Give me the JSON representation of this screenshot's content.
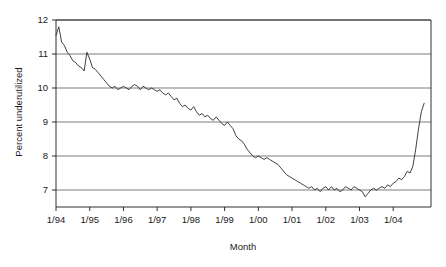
{
  "chart_data": {
    "type": "line",
    "title": "",
    "xlabel": "Month",
    "ylabel": "Percent underutilized",
    "ylim": [
      6.5,
      12
    ],
    "yticks": [
      7,
      8,
      9,
      10,
      11,
      12
    ],
    "ytick_labels": [
      "7",
      "8",
      "9",
      "10",
      "11",
      "12"
    ],
    "xtick_labels": [
      "1/94",
      "1/95",
      "1/96",
      "1/97",
      "1/98",
      "1/99",
      "1/00",
      "1/01",
      "1/02",
      "1/03",
      "1/04"
    ],
    "grid": "horizontal",
    "legend": "none",
    "line_color": "#2b2b2b",
    "grid_color": "#6e6e6e",
    "axis_color": "#1a1a1a",
    "x_start_label": "1/94",
    "x_end_label": "12/04",
    "x": [
      "1/94",
      "2/94",
      "3/94",
      "4/94",
      "5/94",
      "6/94",
      "7/94",
      "8/94",
      "9/94",
      "10/94",
      "11/94",
      "12/94",
      "1/95",
      "2/95",
      "3/95",
      "4/95",
      "5/95",
      "6/95",
      "7/95",
      "8/95",
      "9/95",
      "10/95",
      "11/95",
      "12/95",
      "1/96",
      "2/96",
      "3/96",
      "4/96",
      "5/96",
      "6/96",
      "7/96",
      "8/96",
      "9/96",
      "10/96",
      "11/96",
      "12/96",
      "1/97",
      "2/97",
      "3/97",
      "4/97",
      "5/97",
      "6/97",
      "7/97",
      "8/97",
      "9/97",
      "10/97",
      "11/97",
      "12/97",
      "1/98",
      "2/98",
      "3/98",
      "4/98",
      "5/98",
      "6/98",
      "7/98",
      "8/98",
      "9/98",
      "10/98",
      "11/98",
      "12/98",
      "1/99",
      "2/99",
      "3/99",
      "4/99",
      "5/99",
      "6/99",
      "7/99",
      "8/99",
      "9/99",
      "10/99",
      "11/99",
      "12/99",
      "1/00",
      "2/00",
      "3/00",
      "4/00",
      "5/00",
      "6/00",
      "7/00",
      "8/00",
      "9/00",
      "10/00",
      "11/00",
      "12/00",
      "1/01",
      "2/01",
      "3/01",
      "4/01",
      "5/01",
      "6/01",
      "7/01",
      "8/01",
      "9/01",
      "10/01",
      "11/01",
      "12/01",
      "1/02",
      "2/02",
      "3/02",
      "4/02",
      "5/02",
      "6/02",
      "7/02",
      "8/02",
      "9/02",
      "10/02",
      "11/02",
      "12/02",
      "1/03",
      "2/03",
      "3/03",
      "4/03",
      "5/03",
      "6/03",
      "7/03",
      "8/03",
      "9/03",
      "10/03",
      "11/03",
      "12/03",
      "1/04",
      "2/04",
      "3/04",
      "4/04",
      "5/04",
      "6/04",
      "7/04",
      "8/04",
      "9/04",
      "10/04",
      "11/04",
      "12/04"
    ],
    "values": [
      11.55,
      11.8,
      11.35,
      11.25,
      11.05,
      10.95,
      10.8,
      10.75,
      10.65,
      10.6,
      10.5,
      11.05,
      10.85,
      10.6,
      10.55,
      10.45,
      10.35,
      10.25,
      10.15,
      10.05,
      10.0,
      10.05,
      9.95,
      10.0,
      10.05,
      10.0,
      9.95,
      10.05,
      10.1,
      10.05,
      9.95,
      10.05,
      10.0,
      9.95,
      10.0,
      9.95,
      9.9,
      9.95,
      9.85,
      9.8,
      9.85,
      9.75,
      9.65,
      9.7,
      9.55,
      9.45,
      9.5,
      9.4,
      9.35,
      9.45,
      9.3,
      9.2,
      9.25,
      9.15,
      9.2,
      9.1,
      9.05,
      9.15,
      9.05,
      8.95,
      8.9,
      9.0,
      8.9,
      8.8,
      8.6,
      8.5,
      8.45,
      8.35,
      8.2,
      8.1,
      8.0,
      7.95,
      8.0,
      7.95,
      7.9,
      7.95,
      7.9,
      7.85,
      7.8,
      7.75,
      7.65,
      7.55,
      7.45,
      7.4,
      7.35,
      7.3,
      7.25,
      7.2,
      7.15,
      7.1,
      7.05,
      7.1,
      7.0,
      7.05,
      6.95,
      7.05,
      7.1,
      7.0,
      7.1,
      7.0,
      7.05,
      6.95,
      7.0,
      7.1,
      7.05,
      7.0,
      7.1,
      7.05,
      7.0,
      6.95,
      6.8,
      6.9,
      7.0,
      7.05,
      7.0,
      7.05,
      7.1,
      7.05,
      7.15,
      7.1,
      7.2,
      7.25,
      7.35,
      7.3,
      7.4,
      7.55,
      7.5,
      7.7,
      8.2,
      8.8,
      9.3,
      9.55
    ]
  },
  "axis": {
    "ylabel": "Percent underutilized",
    "xlabel": "Month"
  }
}
